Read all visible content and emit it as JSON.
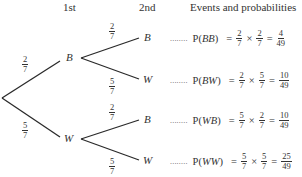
{
  "headers": {
    "first": "1st",
    "second": "2nd",
    "events": "Events and probabilities"
  },
  "tree": {
    "level1": [
      {
        "label": "B",
        "prob": {
          "num": "2",
          "den": "7"
        }
      },
      {
        "label": "W",
        "prob": {
          "num": "5",
          "den": "7"
        }
      }
    ],
    "level2": [
      {
        "parent": "B",
        "label": "B",
        "prob": {
          "num": "2",
          "den": "7"
        }
      },
      {
        "parent": "B",
        "label": "W",
        "prob": {
          "num": "5",
          "den": "7"
        }
      },
      {
        "parent": "W",
        "label": "B",
        "prob": {
          "num": "2",
          "den": "7"
        }
      },
      {
        "parent": "W",
        "label": "W",
        "prob": {
          "num": "5",
          "den": "7"
        }
      }
    ]
  },
  "events": [
    {
      "dots": "........",
      "p": "P(",
      "outcome": "BB",
      "close": ")",
      "eq": "=",
      "a": {
        "num": "2",
        "den": "7"
      },
      "times": "×",
      "b": {
        "num": "2",
        "den": "7"
      },
      "eq2": "=",
      "result": {
        "num": "4",
        "den": "49"
      }
    },
    {
      "dots": "........",
      "p": "P(",
      "outcome": "BW",
      "close": ")",
      "eq": "=",
      "a": {
        "num": "2",
        "den": "7"
      },
      "times": "×",
      "b": {
        "num": "5",
        "den": "7"
      },
      "eq2": "=",
      "result": {
        "num": "10",
        "den": "49"
      }
    },
    {
      "dots": "........",
      "p": "P(",
      "outcome": "WB",
      "close": ")",
      "eq": "=",
      "a": {
        "num": "5",
        "den": "7"
      },
      "times": "×",
      "b": {
        "num": "2",
        "den": "7"
      },
      "eq2": "=",
      "result": {
        "num": "10",
        "den": "49"
      }
    },
    {
      "dots": "........",
      "p": "P(",
      "outcome": "WW",
      "close": ")",
      "eq": "=",
      "a": {
        "num": "5",
        "den": "7"
      },
      "times": "×",
      "b": {
        "num": "5",
        "den": "7"
      },
      "eq2": "=",
      "result": {
        "num": "25",
        "den": "49"
      }
    }
  ]
}
